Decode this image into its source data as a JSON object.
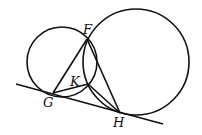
{
  "diagram": {
    "type": "geometry",
    "points": {
      "F": {
        "label": "F",
        "x": 87,
        "y": 39
      },
      "K": {
        "label": "K",
        "x": 88,
        "y": 84
      },
      "G": {
        "label": "G",
        "x": 53,
        "y": 93
      },
      "H": {
        "label": "H",
        "x": 120,
        "y": 113
      }
    },
    "circles": [
      {
        "name": "small-circle",
        "cx": 62,
        "cy": 62,
        "r": 35
      },
      {
        "name": "large-circle",
        "cx": 136,
        "cy": 62,
        "r": 53
      }
    ],
    "tangent_line": {
      "x1": 16,
      "y1": 84,
      "x2": 163,
      "y2": 124
    },
    "segments": [
      {
        "name": "segment-FG",
        "from": "F",
        "to": "G"
      },
      {
        "name": "segment-FH",
        "from": "F",
        "to": "H"
      },
      {
        "name": "segment-GK",
        "from": "G",
        "to": "K"
      },
      {
        "name": "segment-KH",
        "from": "K",
        "to": "H"
      }
    ],
    "labels": {
      "F": {
        "text": "F",
        "x": 83,
        "y": 34
      },
      "K": {
        "text": "K",
        "x": 70,
        "y": 86
      },
      "G": {
        "text": "G",
        "x": 43,
        "y": 107
      },
      "H": {
        "text": "H",
        "x": 113,
        "y": 127
      }
    },
    "stroke_color": "#111111"
  }
}
